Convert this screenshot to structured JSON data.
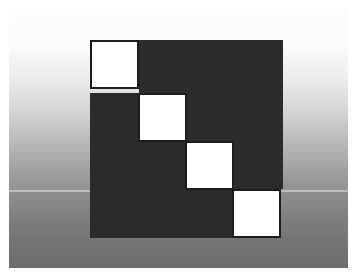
{
  "figure": {
    "canvas": {
      "width": 357,
      "height": 278
    },
    "frame": {
      "border_color": "#ffffff",
      "border_px": 8
    },
    "background": {
      "type": "vertical-gradient",
      "top_color": "#fdfdfd",
      "bottom_color": "#6d6d6d",
      "seam": {
        "y": 182,
        "color": "#ffffff",
        "opacity": 0.42,
        "height_px": 2
      }
    },
    "dark_shape": {
      "name": "staircase-block",
      "color": "#2b2b2b",
      "bounds": {
        "x": 81,
        "y": 32,
        "width": 193,
        "height": 198
      },
      "segments": [
        {
          "name": "row-1",
          "x": 130,
          "y": 32,
          "width": 144,
          "height": 53
        },
        {
          "name": "row-2",
          "x": 81,
          "y": 85,
          "width": 193,
          "height": 48
        },
        {
          "name": "row-3",
          "x": 81,
          "y": 133,
          "width": 193,
          "height": 48
        },
        {
          "name": "row-4",
          "x": 81,
          "y": 181,
          "width": 144,
          "height": 49
        }
      ]
    },
    "tiles": {
      "count": 4,
      "fill": "#ffffff",
      "stroke": "#1c1c1c",
      "stroke_px": 2,
      "size": 49,
      "items": [
        {
          "name": "tile-1",
          "x": 81,
          "y": 32,
          "size": 49
        },
        {
          "name": "tile-2",
          "x": 129,
          "y": 85,
          "size": 49
        },
        {
          "name": "tile-3",
          "x": 176,
          "y": 133,
          "size": 49
        },
        {
          "name": "tile-4",
          "x": 223,
          "y": 181,
          "size": 49
        }
      ]
    }
  }
}
